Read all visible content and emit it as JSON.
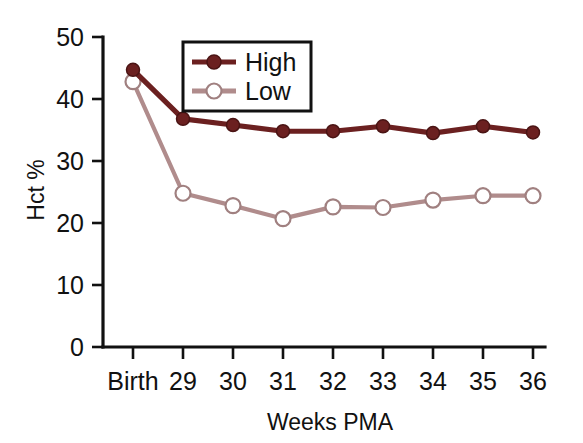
{
  "chart_data": {
    "type": "line",
    "title": "",
    "xlabel": "Weeks PMA",
    "ylabel": "Hct %",
    "categories": [
      "Birth",
      "29",
      "30",
      "31",
      "32",
      "33",
      "34",
      "35",
      "36"
    ],
    "ylim": [
      0,
      50
    ],
    "yticks": [
      0,
      10,
      20,
      30,
      40,
      50
    ],
    "ytick_labels": [
      "0",
      "10",
      "20",
      "30",
      "40",
      "50"
    ],
    "grid": false,
    "legend_position": "top-center",
    "series": [
      {
        "name": "High",
        "color": "#6B2020",
        "marker": "filled-circle",
        "values": [
          44.7,
          36.8,
          35.8,
          34.8,
          34.8,
          35.6,
          34.5,
          35.6,
          34.6
        ]
      },
      {
        "name": "Low",
        "color": "#B08C8C",
        "marker": "open-circle",
        "values": [
          42.8,
          24.8,
          22.8,
          20.7,
          22.6,
          22.5,
          23.7,
          24.4,
          24.4
        ]
      }
    ]
  },
  "legend": {
    "entries": [
      {
        "label": "High"
      },
      {
        "label": "Low"
      }
    ]
  },
  "axes": {
    "y_title": "Hct %",
    "x_title": "Weeks PMA"
  }
}
